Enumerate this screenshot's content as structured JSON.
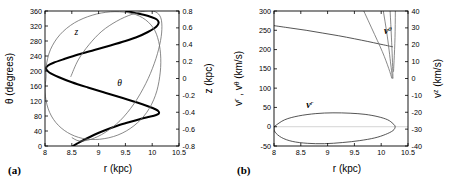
{
  "figure": {
    "background": "#ffffff",
    "width": 459,
    "height": 190
  },
  "panels": [
    {
      "tag": "(a)",
      "xlabel": "r (kpc)",
      "ylabel_left": "θ (degrees)",
      "ylabel_right": "z (kpc)",
      "curve_labels": {
        "theta": "θ",
        "z": "z"
      }
    },
    {
      "tag": "(b)",
      "xlabel": "r (kpc)",
      "ylabel_left_parts": {
        "v1": "v",
        "sup1": "r",
        "sep": " , ",
        "v2": "v",
        "sup2": "θ",
        "units": " (km/s)"
      },
      "ylabel_left": "v r , v θ (km/s)",
      "ylabel_right": "v z (km/s)",
      "curve_labels": {
        "v_theta_base": "v",
        "v_theta_sup": "θ",
        "v_z_base": "v",
        "v_z_sup": "z",
        "v_r_base": "v",
        "v_r_sup": "r"
      }
    }
  ],
  "chart_data": [
    {
      "type": "line",
      "panel": "(a)",
      "title": "",
      "xlabel": "r (kpc)",
      "ylabel": "θ (degrees)",
      "ylabel_secondary": "z (kpc)",
      "xlim": [
        8,
        10.5
      ],
      "ylim": [
        0,
        360
      ],
      "ylim_secondary": [
        -0.8,
        0.8
      ],
      "xticks": [
        8,
        8.5,
        9,
        9.5,
        10,
        10.5
      ],
      "xticklabels": [
        "8",
        "8.5",
        "9",
        "9.5",
        "10",
        "10.5"
      ],
      "yticks": [
        0,
        40,
        80,
        120,
        160,
        200,
        240,
        280,
        320,
        360
      ],
      "yticklabels": [
        "0",
        "40",
        "80",
        "120",
        "160",
        "200",
        "240",
        "280",
        "320",
        "360"
      ],
      "yticks_secondary": [
        -0.8,
        -0.6,
        -0.4,
        -0.2,
        0,
        0.2,
        0.4,
        0.6,
        0.8
      ],
      "yticklabels_secondary": [
        "-0.8",
        "-0.6",
        "-0.4",
        "-0.2",
        "0",
        "0.2",
        "0.4",
        "0.6",
        "0.8"
      ],
      "grid": false,
      "legend_position": "inline-annotation",
      "series": [
        {
          "name": "θ",
          "style": "thick-black",
          "axis": "left",
          "annotation": "θ",
          "annotation_xy": [
            9.35,
            160
          ],
          "points": [
            [
              8.52,
              0
            ],
            [
              8.62,
              8
            ],
            [
              8.75,
              18
            ],
            [
              8.92,
              30
            ],
            [
              9.12,
              42
            ],
            [
              9.35,
              54
            ],
            [
              9.58,
              64
            ],
            [
              9.78,
              72
            ],
            [
              9.95,
              78
            ],
            [
              10.06,
              82
            ],
            [
              10.12,
              86
            ],
            [
              10.12,
              92
            ],
            [
              10.06,
              98
            ],
            [
              9.92,
              106
            ],
            [
              9.72,
              116
            ],
            [
              9.45,
              128
            ],
            [
              9.12,
              142
            ],
            [
              8.8,
              156
            ],
            [
              8.5,
              170
            ],
            [
              8.25,
              184
            ],
            [
              8.08,
              196
            ],
            [
              8.02,
              206
            ],
            [
              8.05,
              214
            ],
            [
              8.16,
              222
            ],
            [
              8.36,
              232
            ],
            [
              8.62,
              244
            ],
            [
              8.92,
              256
            ],
            [
              9.22,
              268
            ],
            [
              9.5,
              280
            ],
            [
              9.74,
              292
            ],
            [
              9.92,
              304
            ],
            [
              10.04,
              314
            ],
            [
              10.1,
              322
            ],
            [
              10.12,
              330
            ],
            [
              10.08,
              338
            ],
            [
              9.98,
              344
            ],
            [
              9.84,
              350
            ],
            [
              9.68,
              355
            ],
            [
              9.52,
              360
            ]
          ]
        },
        {
          "name": "z-loop-outer",
          "style": "thin-gray",
          "axis": "right",
          "annotation": "z",
          "annotation_xy": [
            8.55,
            0.52
          ],
          "points": [
            [
              8.02,
              0.14
            ],
            [
              8.1,
              0.34
            ],
            [
              8.28,
              0.52
            ],
            [
              8.55,
              0.66
            ],
            [
              8.88,
              0.75
            ],
            [
              9.22,
              0.79
            ],
            [
              9.55,
              0.78
            ],
            [
              9.82,
              0.72
            ],
            [
              10.02,
              0.6
            ],
            [
              10.12,
              0.44
            ],
            [
              10.16,
              0.24
            ],
            [
              10.14,
              0.02
            ],
            [
              10.06,
              -0.2
            ],
            [
              9.9,
              -0.4
            ],
            [
              9.66,
              -0.56
            ],
            [
              9.36,
              -0.67
            ],
            [
              9.02,
              -0.72
            ],
            [
              8.7,
              -0.71
            ],
            [
              8.42,
              -0.64
            ],
            [
              8.2,
              -0.52
            ],
            [
              8.06,
              -0.36
            ],
            [
              8.0,
              -0.16
            ],
            [
              8.02,
              0.02
            ],
            [
              8.02,
              0.14
            ]
          ]
        },
        {
          "name": "z-loop-inner",
          "style": "thin-gray",
          "axis": "right",
          "points": [
            [
              8.48,
              0.02
            ],
            [
              8.62,
              0.22
            ],
            [
              8.82,
              0.4
            ],
            [
              9.06,
              0.56
            ],
            [
              9.34,
              0.68
            ],
            [
              9.62,
              0.76
            ],
            [
              9.88,
              0.8
            ],
            [
              10.06,
              0.79
            ],
            [
              10.16,
              0.72
            ],
            [
              10.18,
              0.58
            ],
            [
              10.14,
              0.4
            ],
            [
              10.04,
              0.18
            ],
            [
              9.88,
              -0.06
            ],
            [
              9.66,
              -0.3
            ],
            [
              9.4,
              -0.5
            ],
            [
              9.12,
              -0.64
            ],
            [
              8.86,
              -0.72
            ],
            [
              8.64,
              -0.74
            ],
            [
              8.5,
              -0.7
            ]
          ]
        }
      ]
    },
    {
      "type": "line",
      "panel": "(b)",
      "title": "",
      "xlabel": "r (kpc)",
      "ylabel": "v r , v θ (km/s)",
      "ylabel_secondary": "v z (km/s)",
      "xlim": [
        8,
        10.5
      ],
      "ylim": [
        -50,
        300
      ],
      "ylim_secondary": [
        -40,
        40
      ],
      "xticks": [
        8,
        8.5,
        9,
        9.5,
        10,
        10.5
      ],
      "xticklabels": [
        "8",
        "8.5",
        "9",
        "9.5",
        "10",
        "10.5"
      ],
      "yticks": [
        -50,
        0,
        50,
        100,
        150,
        200,
        250,
        300
      ],
      "yticklabels": [
        "-50",
        "0",
        "50",
        "100",
        "150",
        "200",
        "250",
        "300"
      ],
      "yticks_secondary": [
        -40,
        -30,
        -20,
        -10,
        0,
        10,
        20,
        30,
        40
      ],
      "yticklabels_secondary": [
        "-40",
        "-30",
        "-20",
        "-10",
        "0",
        "10",
        "20",
        "30",
        "40"
      ],
      "grid": false,
      "legend_position": "inline-annotation",
      "series": [
        {
          "name": "v^θ",
          "style": "thin-dark",
          "axis": "left",
          "annotation": "vθ",
          "annotation_xy": [
            10.05,
            240
          ],
          "points": [
            [
              8.0,
              262
            ],
            [
              8.3,
              256
            ],
            [
              8.6,
              250
            ],
            [
              8.9,
              243
            ],
            [
              9.2,
              236
            ],
            [
              9.5,
              228
            ],
            [
              9.75,
              221
            ],
            [
              9.95,
              215
            ],
            [
              10.12,
              210
            ],
            [
              10.22,
              207
            ]
          ]
        },
        {
          "name": "v^z-branch-1",
          "style": "thin-gray",
          "axis": "right",
          "annotation": "vz",
          "annotation_xy": [
            10.05,
            105
          ],
          "points": [
            [
              8.02,
              296
            ],
            [
              8.04,
              270
            ],
            [
              8.1,
              240
            ],
            [
              8.2,
              208
            ],
            [
              8.34,
              176
            ],
            [
              8.52,
              146
            ],
            [
              8.74,
              118
            ],
            [
              9.0,
              92
            ],
            [
              9.28,
              68
            ],
            [
              9.56,
              48
            ],
            [
              9.82,
              30
            ],
            [
              10.02,
              16
            ],
            [
              10.14,
              6
            ],
            [
              10.2,
              0
            ]
          ]
        },
        {
          "name": "v^z-branch-2",
          "style": "thin-gray",
          "axis": "right",
          "points": [
            [
              8.0,
              258
            ],
            [
              8.3,
              232
            ],
            [
              8.6,
              206
            ],
            [
              8.9,
              178
            ],
            [
              9.2,
              148
            ],
            [
              9.5,
              116
            ],
            [
              9.76,
              84
            ],
            [
              9.96,
              54
            ],
            [
              10.1,
              28
            ],
            [
              10.18,
              8
            ],
            [
              10.21,
              0
            ]
          ]
        },
        {
          "name": "v^z-branch-3",
          "style": "thin-gray",
          "axis": "right",
          "points": [
            [
              8.74,
              300
            ],
            [
              8.96,
              272
            ],
            [
              9.18,
              244
            ],
            [
              9.4,
              214
            ],
            [
              9.6,
              182
            ],
            [
              9.78,
              150
            ],
            [
              9.94,
              116
            ],
            [
              10.06,
              82
            ],
            [
              10.15,
              48
            ],
            [
              10.2,
              18
            ],
            [
              10.22,
              0
            ]
          ]
        },
        {
          "name": "v^z-branch-4",
          "style": "thin-gray",
          "axis": "right",
          "points": [
            [
              9.6,
              300
            ],
            [
              9.78,
              268
            ],
            [
              9.94,
              232
            ],
            [
              10.06,
              194
            ],
            [
              10.16,
              152
            ],
            [
              10.22,
              108
            ],
            [
              10.26,
              64
            ],
            [
              10.26,
              28
            ],
            [
              10.23,
              4
            ]
          ]
        },
        {
          "name": "v^r",
          "style": "thin-dark-closed",
          "axis": "left",
          "annotation": "vr",
          "annotation_xy": [
            8.6,
            48
          ],
          "points": [
            [
              8.02,
              2
            ],
            [
              8.2,
              18
            ],
            [
              8.46,
              28
            ],
            [
              8.78,
              34
            ],
            [
              9.1,
              36
            ],
            [
              9.42,
              35
            ],
            [
              9.7,
              32
            ],
            [
              9.94,
              26
            ],
            [
              10.12,
              18
            ],
            [
              10.22,
              8
            ],
            [
              10.26,
              0
            ],
            [
              10.22,
              -10
            ],
            [
              10.08,
              -20
            ],
            [
              9.88,
              -29
            ],
            [
              9.6,
              -36
            ],
            [
              9.28,
              -41
            ],
            [
              8.94,
              -44
            ],
            [
              8.62,
              -43
            ],
            [
              8.34,
              -38
            ],
            [
              8.14,
              -28
            ],
            [
              8.02,
              -14
            ],
            [
              8.0,
              -2
            ],
            [
              8.02,
              2
            ]
          ]
        }
      ]
    }
  ]
}
